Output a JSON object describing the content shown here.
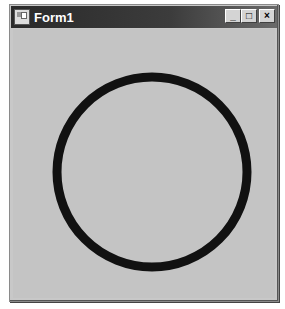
{
  "window": {
    "title": "Form1",
    "controls": {
      "minimize": "_",
      "maximize": "□",
      "close": "×"
    }
  },
  "canvas": {
    "shape": "circle",
    "center_x": 152,
    "center_y": 172,
    "radius": 95,
    "stroke_width": 9,
    "stroke_color": "#111111",
    "background": "#c4c4c4"
  }
}
